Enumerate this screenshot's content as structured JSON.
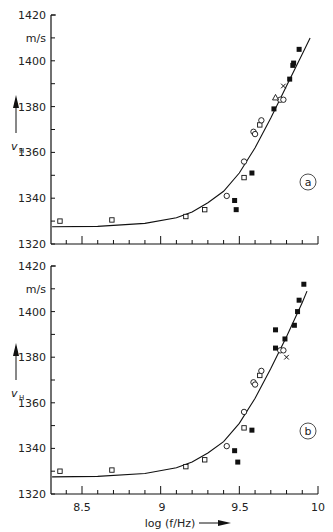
{
  "chart_data": [
    {
      "panel": "a",
      "type": "scatter",
      "title": "",
      "xlabel": "",
      "ylabel": "v_H",
      "yunit": "m/s",
      "xlim": [
        8.31,
        10.0
      ],
      "ylim": [
        1320,
        1420
      ],
      "yticks": [
        1320,
        1340,
        1360,
        1380,
        1400,
        1420
      ],
      "xticks": [
        8.5,
        9,
        9.5,
        10
      ],
      "grid": false,
      "panel_label": "a",
      "fit_curve": {
        "x": [
          8.31,
          8.6,
          8.9,
          9.1,
          9.2,
          9.3,
          9.4,
          9.5,
          9.6,
          9.7,
          9.8,
          9.9,
          9.95
        ],
        "y": [
          1327.5,
          1327.7,
          1329,
          1331.5,
          1334,
          1338,
          1343,
          1351,
          1362,
          1375,
          1389,
          1403,
          1410
        ]
      },
      "series": [
        {
          "name": "open squares",
          "marker": "open-square",
          "points": [
            [
              8.36,
              1330
            ],
            [
              8.69,
              1330.5
            ],
            [
              9.16,
              1332
            ],
            [
              9.28,
              1335
            ],
            [
              9.53,
              1349
            ],
            [
              9.63,
              1372
            ]
          ]
        },
        {
          "name": "open circles",
          "marker": "open-circle",
          "points": [
            [
              9.42,
              1341
            ],
            [
              9.53,
              1356
            ],
            [
              9.59,
              1369
            ],
            [
              9.6,
              1368
            ],
            [
              9.64,
              1374
            ],
            [
              9.76,
              1383
            ],
            [
              9.78,
              1383
            ]
          ]
        },
        {
          "name": "filled squares",
          "marker": "filled-square",
          "points": [
            [
              9.47,
              1339
            ],
            [
              9.48,
              1335
            ],
            [
              9.58,
              1351
            ],
            [
              9.72,
              1379
            ],
            [
              9.82,
              1392
            ],
            [
              9.84,
              1398
            ],
            [
              9.845,
              1399
            ],
            [
              9.88,
              1405
            ]
          ]
        },
        {
          "name": "triangle",
          "marker": "open-triangle",
          "points": [
            [
              9.73,
              1384
            ]
          ]
        },
        {
          "name": "cross",
          "marker": "cross",
          "points": [
            [
              9.78,
              1389
            ]
          ]
        }
      ]
    },
    {
      "panel": "b",
      "type": "scatter",
      "title": "",
      "xlabel": "log(f/Hz)",
      "ylabel": "v_H",
      "yunit": "m/s",
      "xlim": [
        8.31,
        10.0
      ],
      "ylim": [
        1320,
        1420
      ],
      "yticks": [
        1320,
        1340,
        1360,
        1380,
        1400,
        1420
      ],
      "xticks": [
        8.5,
        9,
        9.5,
        10
      ],
      "grid": false,
      "panel_label": "b",
      "fit_curve": {
        "x": [
          8.31,
          8.6,
          8.9,
          9.1,
          9.2,
          9.3,
          9.4,
          9.5,
          9.6,
          9.7,
          9.8,
          9.9,
          9.93
        ],
        "y": [
          1327.5,
          1327.7,
          1329,
          1331.5,
          1334,
          1338,
          1343,
          1351,
          1362,
          1375,
          1389,
          1404,
          1409
        ]
      },
      "series": [
        {
          "name": "open squares",
          "marker": "open-square",
          "points": [
            [
              8.36,
              1330
            ],
            [
              8.69,
              1330.5
            ],
            [
              9.16,
              1332
            ],
            [
              9.28,
              1335
            ],
            [
              9.53,
              1349
            ],
            [
              9.63,
              1372
            ]
          ]
        },
        {
          "name": "open circles",
          "marker": "open-circle",
          "points": [
            [
              9.42,
              1341
            ],
            [
              9.53,
              1356
            ],
            [
              9.59,
              1369
            ],
            [
              9.6,
              1368
            ],
            [
              9.64,
              1374
            ],
            [
              9.76,
              1383
            ],
            [
              9.78,
              1383
            ]
          ]
        },
        {
          "name": "filled squares",
          "marker": "filled-square",
          "points": [
            [
              9.47,
              1339
            ],
            [
              9.49,
              1334
            ],
            [
              9.58,
              1348
            ],
            [
              9.73,
              1384
            ],
            [
              9.73,
              1392
            ],
            [
              9.79,
              1388
            ],
            [
              9.85,
              1394
            ],
            [
              9.87,
              1400
            ],
            [
              9.88,
              1405
            ],
            [
              9.91,
              1412
            ]
          ]
        },
        {
          "name": "cross",
          "marker": "cross",
          "points": [
            [
              9.8,
              1380
            ]
          ]
        }
      ]
    }
  ],
  "labels": {
    "panel_a": {
      "y_unit": "m/s",
      "y_symbol": "v",
      "y_symbol_sub": "H",
      "y_ticks": [
        "1420",
        "1400",
        "1380",
        "1360",
        "1340",
        "1320"
      ],
      "badge": "a"
    },
    "panel_b": {
      "y_unit": "m/s",
      "y_symbol": "v",
      "y_symbol_sub": "H",
      "y_ticks": [
        "1420",
        "1400",
        "1380",
        "1360",
        "1340",
        "1320"
      ],
      "x_ticks": [
        "8.5",
        "9",
        "9.5",
        "10"
      ],
      "x_label": "log (f/Hz)",
      "badge": "b"
    }
  }
}
